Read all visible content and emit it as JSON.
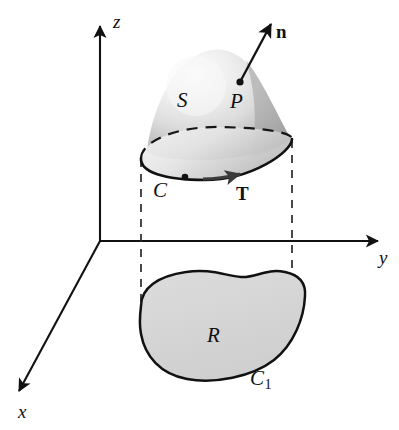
{
  "figure": {
    "background_color": "#ffffff",
    "ink_color": "#111111",
    "region_fill_color": "#d4d4d4",
    "surface_light_color": "#f2f2f2",
    "surface_dark_color": "#9a9a9a",
    "ellipse_fill_color": "#e8e8e8"
  },
  "axes": {
    "z_label": "z",
    "y_label": "y",
    "x_label": "x",
    "origin": {
      "x": 100,
      "y": 241
    }
  },
  "surface": {
    "label": "S",
    "point_label": "P",
    "normal_label": "n"
  },
  "boundary": {
    "curve_label": "C",
    "tangent_label": "T"
  },
  "projection": {
    "region_label": "R",
    "curve_label": "C",
    "curve_subscript": "1"
  }
}
